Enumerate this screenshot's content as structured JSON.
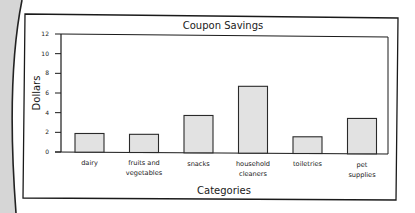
{
  "chart_data": {
    "type": "bar",
    "title": "Coupon Savings",
    "xlabel": "Categories",
    "ylabel": "Dollars",
    "categories": [
      [
        "dairy"
      ],
      [
        "fruits and",
        "vegetables"
      ],
      [
        "snacks"
      ],
      [
        "household",
        "cleaners"
      ],
      [
        "toiletries"
      ],
      [
        "pet",
        "supplies"
      ]
    ],
    "category_names": [
      "dairy",
      "fruits and vegetables",
      "snacks",
      "household cleaners",
      "toiletries",
      "pet supplies"
    ],
    "values": [
      1.9,
      1.85,
      3.8,
      6.8,
      1.7,
      3.6
    ],
    "ylim": [
      0,
      12
    ],
    "yticks": [
      0,
      2,
      4,
      6,
      8,
      10,
      12
    ],
    "grid": false,
    "legend": null,
    "colors": {
      "bar_fill": "#e2e2e2",
      "bar_stroke": "#2a2a2a",
      "axis": "#1a1a1a",
      "frame": "#1a1a1a",
      "page_strip": "#d6d6d6",
      "background": "#ffffff"
    }
  }
}
